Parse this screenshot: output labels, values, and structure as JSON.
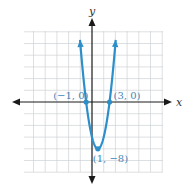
{
  "chart_data": {
    "type": "line",
    "title": "",
    "function": "y = 2(x + 1)(x - 3)",
    "xlabel": "x",
    "ylabel": "y",
    "xlim": [
      -12,
      12
    ],
    "ylim": [
      -12,
      12
    ],
    "grid": true,
    "grid_step": {
      "x": 2,
      "y": 2
    },
    "series": [
      {
        "name": "parabola",
        "color": "#2d8fc9",
        "a": 2,
        "b": -4,
        "c": -6,
        "x_range": [
          -2.05,
          4.05
        ]
      }
    ],
    "points": [
      {
        "x": -1,
        "y": 0,
        "label": "(−1, 0)"
      },
      {
        "x": 3,
        "y": 0,
        "label": "(3, 0)"
      },
      {
        "x": 1,
        "y": -8,
        "label": "(1, −8)"
      }
    ]
  }
}
